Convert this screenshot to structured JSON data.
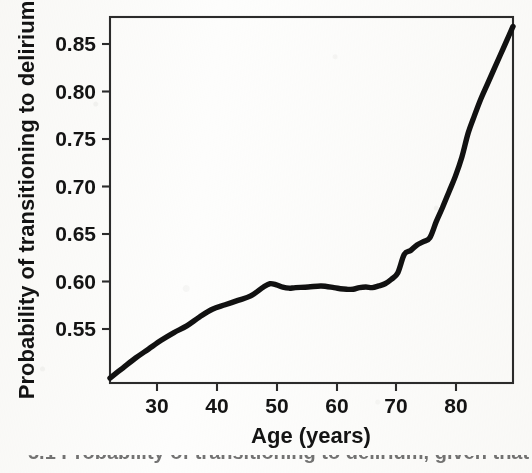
{
  "figure": {
    "background_color": "#fdfdfc",
    "ink_color": "#111111",
    "caption_partial": "5.1 Probability of transitioning to delirium, given that"
  },
  "chart_data": {
    "type": "line",
    "title": "",
    "xlabel": "Age (years)",
    "ylabel": "Probability of transitioning to delirium",
    "xlim": [
      24,
      87
    ],
    "ylim": [
      0.5425,
      0.8725
    ],
    "xticks": [
      30,
      40,
      50,
      60,
      70,
      80
    ],
    "xtick_labels": [
      "30",
      "40",
      "50",
      "60",
      "70",
      "80"
    ],
    "yticks": [
      0.55,
      0.6,
      0.65,
      0.7,
      0.75,
      0.8,
      0.85
    ],
    "ytick_labels": [
      "0.55",
      "0.60",
      "0.65",
      "0.70",
      "0.75",
      "0.80",
      "0.85"
    ],
    "grid": false,
    "legend": null,
    "series": [
      {
        "name": "Probability of transitioning to delirium",
        "color": "#111111",
        "linewidth": 5.4,
        "x": [
          24,
          26,
          28,
          30,
          32,
          34,
          36,
          38,
          40,
          42,
          44,
          46,
          48,
          49,
          50,
          51,
          52,
          53,
          55,
          57,
          59,
          60,
          61,
          62,
          63,
          64,
          65,
          66,
          67,
          68,
          69,
          70,
          71,
          72,
          73,
          74,
          75,
          76,
          77,
          78,
          79,
          80,
          81,
          82,
          83,
          84,
          85,
          86,
          87
        ],
        "y": [
          0.547,
          0.556,
          0.565,
          0.573,
          0.581,
          0.588,
          0.594,
          0.602,
          0.609,
          0.613,
          0.617,
          0.621,
          0.629,
          0.632,
          0.631,
          0.629,
          0.628,
          0.6285,
          0.629,
          0.63,
          0.6285,
          0.6275,
          0.627,
          0.627,
          0.6285,
          0.629,
          0.6285,
          0.63,
          0.632,
          0.636,
          0.642,
          0.6585,
          0.662,
          0.667,
          0.67,
          0.6735,
          0.688,
          0.701,
          0.715,
          0.729,
          0.746,
          0.768,
          0.784,
          0.799,
          0.812,
          0.825,
          0.838,
          0.851,
          0.864
        ]
      }
    ]
  },
  "plot_geometry": {
    "box_left": 110,
    "box_right": 513,
    "box_top": 17,
    "box_bottom": 383
  }
}
